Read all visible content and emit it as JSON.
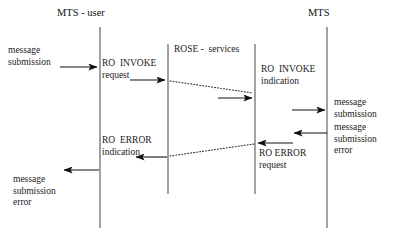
{
  "diagram": {
    "title_left": "MTS - user",
    "title_right": "MTS",
    "box_label": "ROSE -  services",
    "lifelines": [
      {
        "name": "mts-user-lifeline",
        "x": 100
      },
      {
        "name": "rose-left-lifeline",
        "x": 168
      },
      {
        "name": "rose-right-lifeline",
        "x": 255
      },
      {
        "name": "mts-lifeline",
        "x": 327
      }
    ],
    "labels": {
      "message_submission_left": "message\nsubmission",
      "ro_invoke_request": "RO  INVOKE\nrequest",
      "ro_invoke_indication": "RO  INVOKE\nindication",
      "message_submission_right": "message\nsubmission",
      "message_submission_error_right": "message\nsubmission\nerror",
      "ro_error_indication": "RO  ERROR\nindication",
      "ro_error_request": "RO ERROR\nrequest",
      "message_submission_error_left": "message\nsubmission\nerror"
    },
    "arrows": [
      {
        "name": "arrow-message-submission-in",
        "direction": "right",
        "x1": 60,
        "y1": 67,
        "x2": 99,
        "y2": 67,
        "style": "solid"
      },
      {
        "name": "arrow-ro-invoke-request",
        "direction": "right",
        "x1": 130,
        "y1": 80,
        "x2": 167,
        "y2": 80,
        "style": "solid"
      },
      {
        "name": "arrow-ro-invoke-transfer",
        "direction": "right",
        "x1": 169,
        "y1": 81,
        "x2": 254,
        "y2": 93,
        "style": "dotted"
      },
      {
        "name": "arrow-ro-invoke-indication",
        "direction": "right",
        "x1": 218,
        "y1": 98,
        "x2": 254,
        "y2": 98,
        "style": "solid"
      },
      {
        "name": "arrow-message-submission-out",
        "direction": "right",
        "x1": 292,
        "y1": 110,
        "x2": 327,
        "y2": 110,
        "style": "solid"
      },
      {
        "name": "arrow-message-submission-error-in",
        "direction": "left",
        "x1": 327,
        "y1": 133,
        "x2": 292,
        "y2": 133,
        "style": "solid"
      },
      {
        "name": "arrow-ro-error-request",
        "direction": "left",
        "x1": 293,
        "y1": 143,
        "x2": 256,
        "y2": 143,
        "style": "solid"
      },
      {
        "name": "arrow-ro-error-transfer",
        "direction": "left",
        "x1": 254,
        "y1": 144,
        "x2": 170,
        "y2": 156,
        "style": "dotted"
      },
      {
        "name": "arrow-ro-error-indication",
        "direction": "left",
        "x1": 167,
        "y1": 157,
        "x2": 134,
        "y2": 157,
        "style": "solid"
      },
      {
        "name": "arrow-message-submission-error-out",
        "direction": "left",
        "x1": 99,
        "y1": 170,
        "x2": 62,
        "y2": 170,
        "style": "solid"
      }
    ]
  }
}
